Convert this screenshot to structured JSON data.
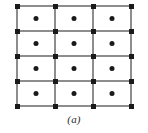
{
  "figure": {
    "caption": "(a)",
    "type": "lattice-grid-diagram",
    "colors": {
      "background": "#ffffff",
      "grid_line": "#8d8d8d",
      "node": "#1a1a1a",
      "cell_dot": "#1a1a1a",
      "caption_text": "#2b2b2b"
    },
    "geometry": {
      "columns": 3,
      "rows": 4,
      "x_positions": [
        17,
        55,
        93,
        131
      ],
      "y_positions": [
        6,
        31,
        56,
        81,
        106
      ],
      "node_size": 5,
      "cell_dot_diameter": 5,
      "grid_line_width": 1.6
    },
    "nodes": [
      {
        "x": 17,
        "y": 6
      },
      {
        "x": 55,
        "y": 6
      },
      {
        "x": 93,
        "y": 6
      },
      {
        "x": 131,
        "y": 6
      },
      {
        "x": 17,
        "y": 31
      },
      {
        "x": 55,
        "y": 31
      },
      {
        "x": 93,
        "y": 31
      },
      {
        "x": 131,
        "y": 31
      },
      {
        "x": 17,
        "y": 56
      },
      {
        "x": 55,
        "y": 56
      },
      {
        "x": 93,
        "y": 56
      },
      {
        "x": 131,
        "y": 56
      },
      {
        "x": 17,
        "y": 81
      },
      {
        "x": 55,
        "y": 81
      },
      {
        "x": 93,
        "y": 81
      },
      {
        "x": 131,
        "y": 81
      },
      {
        "x": 17,
        "y": 106
      },
      {
        "x": 55,
        "y": 106
      },
      {
        "x": 93,
        "y": 106
      },
      {
        "x": 131,
        "y": 106
      }
    ],
    "cell_dots": [
      {
        "x": 36,
        "y": 18.5
      },
      {
        "x": 74,
        "y": 18.5
      },
      {
        "x": 112,
        "y": 18.5
      },
      {
        "x": 36,
        "y": 43.5
      },
      {
        "x": 74,
        "y": 43.5
      },
      {
        "x": 112,
        "y": 43.5
      },
      {
        "x": 36,
        "y": 68.5
      },
      {
        "x": 74,
        "y": 68.5
      },
      {
        "x": 112,
        "y": 68.5
      },
      {
        "x": 36,
        "y": 93.5
      },
      {
        "x": 74,
        "y": 93.5
      },
      {
        "x": 112,
        "y": 93.5
      }
    ],
    "horizontal_lines": [
      {
        "x1": 17,
        "y1": 6,
        "x2": 131,
        "y2": 6
      },
      {
        "x1": 17,
        "y1": 31,
        "x2": 131,
        "y2": 31
      },
      {
        "x1": 17,
        "y1": 56,
        "x2": 131,
        "y2": 56
      },
      {
        "x1": 17,
        "y1": 81,
        "x2": 131,
        "y2": 81
      },
      {
        "x1": 17,
        "y1": 106,
        "x2": 131,
        "y2": 106
      }
    ],
    "vertical_lines": [
      {
        "x1": 17,
        "y1": 6,
        "x2": 17,
        "y2": 106
      },
      {
        "x1": 55,
        "y1": 6,
        "x2": 55,
        "y2": 106
      },
      {
        "x1": 93,
        "y1": 6,
        "x2": 93,
        "y2": 106
      },
      {
        "x1": 131,
        "y1": 6,
        "x2": 131,
        "y2": 106
      }
    ]
  }
}
